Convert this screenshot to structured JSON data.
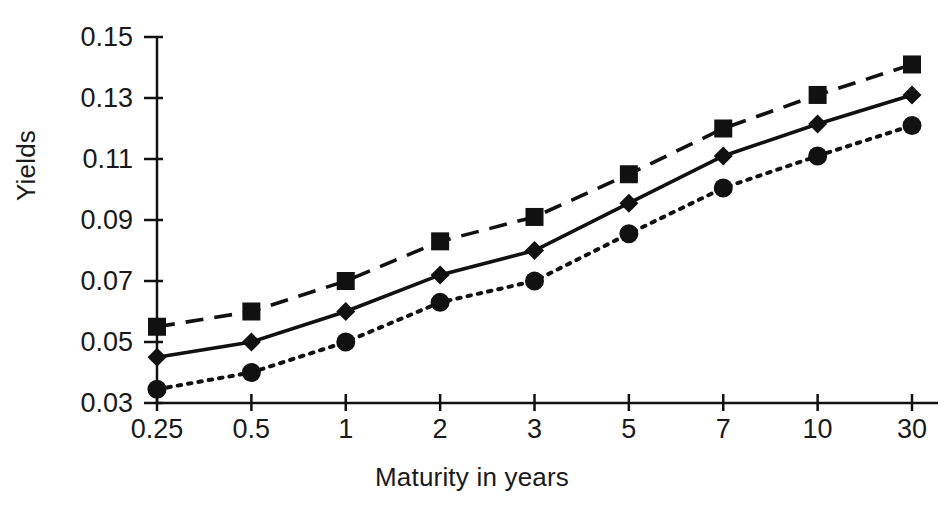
{
  "chart_data": {
    "type": "line",
    "title": "",
    "xlabel": "Maturity in years",
    "ylabel": "Yields",
    "categories": [
      "0.25",
      "0.5",
      "1",
      "2",
      "3",
      "5",
      "7",
      "10",
      "30"
    ],
    "ytick_labels": [
      "0.03",
      "0.05",
      "0.07",
      "0.09",
      "0.11",
      "0.13",
      "0.15"
    ],
    "yticks": [
      0.03,
      0.05,
      0.07,
      0.09,
      0.11,
      0.13,
      0.15
    ],
    "ylim": [
      0.03,
      0.15
    ],
    "grid": false,
    "legend": "none",
    "series": [
      {
        "name": "upper",
        "marker": "square",
        "linestyle": "dashed",
        "color": "#111111",
        "values": [
          0.055,
          0.06,
          0.07,
          0.083,
          0.091,
          0.105,
          0.12,
          0.131,
          0.141
        ]
      },
      {
        "name": "middle",
        "marker": "diamond",
        "linestyle": "solid",
        "color": "#111111",
        "values": [
          0.045,
          0.05,
          0.06,
          0.072,
          0.08,
          0.0955,
          0.111,
          0.1215,
          0.131
        ]
      },
      {
        "name": "lower",
        "marker": "circle",
        "linestyle": "dotted",
        "color": "#111111",
        "values": [
          0.0345,
          0.04,
          0.05,
          0.063,
          0.07,
          0.0855,
          0.1005,
          0.111,
          0.121
        ]
      }
    ]
  },
  "axes": {
    "yaxis_name": "y-axis",
    "xaxis_name": "x-axis"
  }
}
